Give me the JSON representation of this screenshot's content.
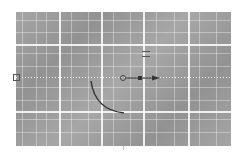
{
  "canvas": {
    "background_color": "#9b9b9b",
    "grid_color": "#ffffff",
    "major_grid_x": [
      59,
      101,
      143,
      188
    ],
    "major_grid_y": [
      44,
      111
    ],
    "guide_y": 77
  },
  "icons": {
    "guide_handle": "square-handle-icon",
    "gizmo_origin": "circle-handle-icon",
    "gizmo_center": "filled-square-handle-icon",
    "gizmo_axis": "arrow-right-icon",
    "marker": "equals-marker-icon"
  },
  "curve": {
    "stroke_color": "#333333",
    "path": "M 91 81 Q 95 110 124 113"
  },
  "gizmo": {
    "circle_x": 123,
    "circle_y": 78,
    "square_x": 140,
    "square_y": 78,
    "arrow_x": 158,
    "arrow_y": 78,
    "color": "#444444"
  }
}
